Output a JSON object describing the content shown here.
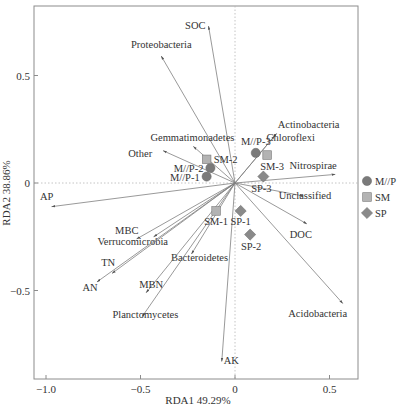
{
  "chart_data": {
    "type": "scatter",
    "subtype": "rda-biplot",
    "title": "",
    "xlabel": "RDA1 49.29%",
    "ylabel": "RDA2 38.86%",
    "xlim": [
      -1.06,
      0.65
    ],
    "ylim": [
      -0.91,
      0.82
    ],
    "xticks": [
      -1.0,
      -0.5,
      0,
      0.5
    ],
    "xtick_labels": [
      "-1.0",
      "-0.5",
      "0",
      "0.5"
    ],
    "yticks": [
      0.5,
      0,
      -0.5
    ],
    "ytick_labels": [
      "0.5",
      "0",
      "-0.5"
    ],
    "grid": false,
    "zero_lines": "dotted",
    "legend_position": "right",
    "legend": [
      {
        "name": "M//P",
        "marker": "circle",
        "color": "#7a7a7a"
      },
      {
        "name": "SM",
        "marker": "square",
        "color": "#b0b0b0"
      },
      {
        "name": "SP",
        "marker": "diamond",
        "color": "#8a8a8a"
      }
    ],
    "arrows": [
      {
        "label": "SOC",
        "x": -0.14,
        "y": 0.73
      },
      {
        "label": "Proteobacteria",
        "x": -0.39,
        "y": 0.59
      },
      {
        "label": "Gemmatimonadetes",
        "x": -0.22,
        "y": 0.17
      },
      {
        "label": "Other",
        "x": -0.38,
        "y": 0.15
      },
      {
        "label": "Actinobacteria",
        "x": 0.22,
        "y": 0.23
      },
      {
        "label": "Chloroflexi",
        "x": 0.21,
        "y": 0.22
      },
      {
        "label": "Nitrospirae",
        "x": 0.53,
        "y": 0.04
      },
      {
        "label": "Unclassified",
        "x": 0.36,
        "y": -0.06
      },
      {
        "label": "DOC",
        "x": 0.38,
        "y": -0.19
      },
      {
        "label": "Acidobacteria",
        "x": 0.57,
        "y": -0.56
      },
      {
        "label": "AK",
        "x": -0.07,
        "y": -0.83
      },
      {
        "label": "AP",
        "x": -0.97,
        "y": -0.11
      },
      {
        "label": "MBC",
        "x": -0.52,
        "y": -0.26
      },
      {
        "label": "Verrucomicrobia",
        "x": -0.43,
        "y": -0.25
      },
      {
        "label": "TN",
        "x": -0.65,
        "y": -0.42
      },
      {
        "label": "AN",
        "x": -0.73,
        "y": -0.46
      },
      {
        "label": "Bacteroidetes",
        "x": -0.23,
        "y": -0.33
      },
      {
        "label": "MBN",
        "x": -0.47,
        "y": -0.51
      },
      {
        "label": "Planctomycetes",
        "x": -0.49,
        "y": -0.62
      }
    ],
    "series": [
      {
        "name": "M//P",
        "marker": "circle",
        "points": [
          {
            "label": "M//P-1",
            "x": -0.15,
            "y": 0.03
          },
          {
            "label": "M//P-2",
            "x": -0.13,
            "y": 0.07
          },
          {
            "label": "M//P-3",
            "x": 0.11,
            "y": 0.14
          }
        ]
      },
      {
        "name": "SM",
        "marker": "square",
        "points": [
          {
            "label": "SM-1",
            "x": -0.1,
            "y": -0.13
          },
          {
            "label": "SM-2",
            "x": -0.15,
            "y": 0.11
          },
          {
            "label": "SM-3",
            "x": 0.17,
            "y": 0.13
          }
        ]
      },
      {
        "name": "SP",
        "marker": "diamond",
        "points": [
          {
            "label": "SP-1",
            "x": 0.03,
            "y": -0.13
          },
          {
            "label": "SP-2",
            "x": 0.08,
            "y": -0.24
          },
          {
            "label": "SP-3",
            "x": 0.15,
            "y": 0.03
          }
        ]
      }
    ]
  },
  "layout": {
    "origin_px": [
      235,
      183
    ],
    "x_px_per_unit": 189,
    "y_px_per_unit": 215,
    "frame": {
      "left": 34,
      "top": 6,
      "right": 358,
      "bottom": 379
    },
    "arrow_color": "#7f7f7f",
    "text_color": "#333333"
  }
}
